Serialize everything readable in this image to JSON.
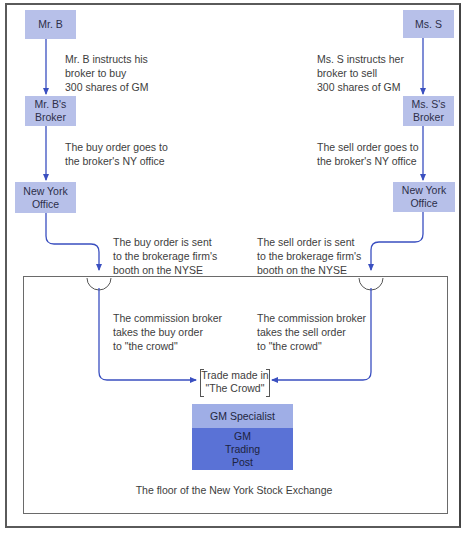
{
  "diagram": {
    "title_caption": "The floor of the New York Stock Exchange",
    "buyer_side": {
      "party": "Mr. B",
      "broker": "Mr. B's Broker",
      "broker_lines": [
        "Mr. B's",
        "Broker"
      ],
      "office_lines": [
        "New York",
        "Office"
      ],
      "step1": "Mr. B instructs his\nbroker to buy\n300 shares of GM",
      "step2": "The buy order goes to\nthe broker's NY office",
      "step3": "The buy order is sent\nto the brokerage firm's\nbooth on the NYSE",
      "step4": "The commission broker\ntakes the buy order\nto \"the crowd\""
    },
    "seller_side": {
      "party": "Ms. S",
      "broker": "Ms. S's Broker",
      "broker_lines": [
        "Ms. S's",
        "Broker"
      ],
      "office_lines": [
        "New York",
        "Office"
      ],
      "step1": "Ms. S instructs her\nbroker to sell\n300 shares of GM",
      "step2": "The sell order goes to\nthe broker's NY office",
      "step3": "The sell order is sent\nto the brokerage firm's\nbooth on the NYSE",
      "step4": "The commission broker\ntakes the sell order\nto \"the crowd\""
    },
    "trade": {
      "line1": "Trade made in",
      "line2": "\"The Crowd\""
    },
    "specialist": {
      "label": "GM Specialist",
      "post_lines": [
        "GM",
        "Trading",
        "Post"
      ]
    },
    "colors": {
      "node_fill": "#b7c0e9",
      "specialist_fill": "#9faee6",
      "post_fill": "#5a72d6",
      "arrow": "#3a4fc0",
      "border": "#5a5a5a"
    }
  }
}
